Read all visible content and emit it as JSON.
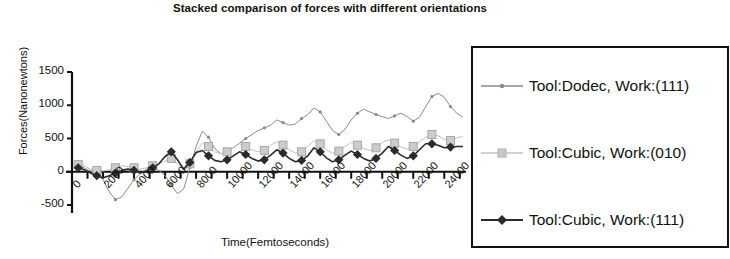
{
  "chart_data": {
    "type": "line",
    "title": "Stacked comparison of forces with different orientations",
    "xlabel": "Time(Femtoseconds)",
    "ylabel": "Forces(Nanonewtons)",
    "xlim": [
      0,
      25400
    ],
    "ylim": [
      -500,
      1500
    ],
    "yticks": [
      -500,
      0,
      500,
      1000,
      1500
    ],
    "xticks": [
      0,
      2000,
      4000,
      6000,
      8000,
      10000,
      12000,
      14000,
      16000,
      18000,
      20000,
      22000,
      24000
    ],
    "xtick_labels": [
      "0",
      "2000",
      "4000",
      "6000",
      "8000",
      "10000",
      "12000",
      "14000",
      "16000",
      "18000",
      "20000",
      "22000",
      "24000"
    ],
    "minor_xtick_step": 1000,
    "grid": false,
    "legend_position": "right-outside",
    "x": [
      400,
      800,
      1200,
      1600,
      2000,
      2400,
      2800,
      3200,
      3600,
      4000,
      4400,
      4800,
      5200,
      5600,
      6000,
      6400,
      6800,
      7200,
      7600,
      8000,
      8400,
      8800,
      9200,
      9600,
      10000,
      10400,
      10800,
      11200,
      11600,
      12000,
      12400,
      12800,
      13200,
      13600,
      14000,
      14400,
      14800,
      15200,
      15600,
      16000,
      16400,
      16800,
      17200,
      17600,
      18000,
      18400,
      18800,
      19200,
      19600,
      20000,
      20400,
      20800,
      21200,
      21600,
      22000,
      22400,
      22800,
      23200,
      23600,
      24000,
      24400,
      24800,
      25200
    ],
    "series": [
      {
        "name": "Tool:Dodec, Work:(111)",
        "color": "#8a8a8a",
        "marker": "dot",
        "linewidth": 1,
        "values": [
          120,
          60,
          10,
          -40,
          -120,
          -300,
          -420,
          -380,
          -250,
          -120,
          -30,
          40,
          60,
          20,
          -60,
          -200,
          -330,
          -260,
          60,
          380,
          610,
          520,
          350,
          270,
          300,
          360,
          430,
          500,
          560,
          620,
          660,
          700,
          780,
          740,
          700,
          720,
          800,
          860,
          960,
          900,
          760,
          620,
          560,
          640,
          780,
          880,
          940,
          900,
          860,
          830,
          800,
          840,
          880,
          830,
          760,
          820,
          980,
          1130,
          1180,
          1120,
          980,
          880,
          820
        ]
      },
      {
        "name": "Tool:Cubic, Work:(010)",
        "color": "#c2c2c2",
        "marker": "square",
        "linewidth": 1,
        "values": [
          110,
          90,
          40,
          20,
          10,
          30,
          60,
          90,
          80,
          60,
          40,
          60,
          90,
          120,
          160,
          200,
          120,
          30,
          120,
          300,
          430,
          380,
          300,
          270,
          300,
          360,
          420,
          380,
          330,
          300,
          320,
          400,
          450,
          400,
          330,
          280,
          300,
          380,
          470,
          420,
          330,
          280,
          310,
          380,
          440,
          400,
          350,
          320,
          360,
          440,
          480,
          430,
          370,
          340,
          380,
          450,
          520,
          560,
          540,
          490,
          470,
          510,
          530
        ]
      },
      {
        "name": "Tool:Cubic, Work:(111)",
        "color": "#2b2b2b",
        "marker": "diamond",
        "linewidth": 1.6,
        "values": [
          60,
          30,
          -20,
          -60,
          -90,
          -60,
          -20,
          20,
          40,
          20,
          -20,
          10,
          60,
          120,
          230,
          300,
          180,
          40,
          140,
          290,
          320,
          240,
          170,
          150,
          180,
          240,
          300,
          260,
          200,
          160,
          180,
          250,
          330,
          280,
          200,
          150,
          170,
          240,
          360,
          300,
          210,
          150,
          180,
          250,
          310,
          260,
          200,
          160,
          200,
          280,
          380,
          320,
          250,
          200,
          240,
          330,
          420,
          420,
          400,
          360,
          370,
          380,
          380
        ]
      }
    ]
  },
  "legend": {
    "items": [
      {
        "label": "Tool:Dodec, Work:(111)"
      },
      {
        "label": "Tool:Cubic, Work:(010)"
      },
      {
        "label": "Tool:Cubic, Work:(111)"
      }
    ]
  }
}
